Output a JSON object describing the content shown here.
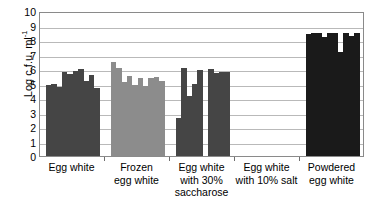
{
  "chart_data": {
    "type": "bar",
    "title": "",
    "subtitle": "",
    "xlabel": "",
    "ylabel": "Log c.f.u. ml",
    "ylabel_exponent": "-1",
    "ylim": [
      0,
      10
    ],
    "ytick_step": 1,
    "yticks": [
      "10",
      "9",
      "8",
      "7",
      "6",
      "5",
      "4",
      "3",
      "2",
      "1",
      "0"
    ],
    "grid": "horizontal",
    "legend": "none",
    "categories": [
      "Egg white",
      "Frozen egg white",
      "Egg white with 30% saccharose",
      "Egg white with 10% salt",
      "Powdered egg white"
    ],
    "category_label_lines": [
      [
        "Egg white"
      ],
      [
        "Frozen",
        "egg white"
      ],
      [
        "Egg white",
        "with 30%",
        "saccharose"
      ],
      [
        "Egg white",
        "with 10% salt"
      ],
      [
        "Powdered",
        "egg white"
      ]
    ],
    "groups": [
      {
        "name": "Egg white",
        "color": "#454545",
        "values": [
          4.9,
          5.0,
          4.75,
          5.8,
          5.65,
          5.85,
          6.0,
          5.2,
          5.6,
          4.7
        ]
      },
      {
        "name": "Frozen egg white",
        "color": "#8c8c8c",
        "values": [
          6.5,
          6.1,
          5.1,
          5.5,
          4.9,
          5.4,
          4.85,
          5.35,
          5.45,
          5.2
        ]
      },
      {
        "name": "Egg white with 30% saccharose",
        "color": "#454545",
        "values": [
          2.6,
          6.1,
          4.15,
          5.0,
          5.9,
          0,
          6.0,
          5.75,
          5.8,
          5.8
        ]
      },
      {
        "name": "Egg white with 10% salt",
        "color": "#454545",
        "values": [
          0,
          0,
          0,
          0,
          0,
          0,
          0,
          0,
          0,
          0
        ]
      },
      {
        "name": "Powdered egg white",
        "color": "#1a1a1a",
        "values": [
          8.4,
          8.5,
          8.5,
          8.2,
          8.5,
          8.5,
          7.2,
          8.5,
          8.3,
          8.5
        ]
      }
    ]
  }
}
